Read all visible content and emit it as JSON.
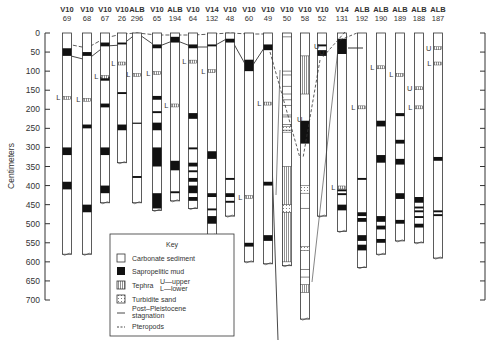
{
  "figure": {
    "y_axis_label": "Centimeters",
    "y_ticks": [
      "0",
      "50",
      "100",
      "150",
      "200",
      "250",
      "300",
      "350",
      "400",
      "450",
      "500",
      "550",
      "600",
      "650",
      "700"
    ],
    "colors": {
      "ink": "#222222",
      "background": "#ffffff",
      "tephra_fill": "#dddddd"
    }
  },
  "cores": [
    {
      "ship": "V10",
      "num": "69"
    },
    {
      "ship": "V10",
      "num": "68"
    },
    {
      "ship": "V10",
      "num": "67"
    },
    {
      "ship": "V10",
      "num": "26"
    },
    {
      "ship": "ALB",
      "num": "296"
    },
    {
      "ship": "V10",
      "num": "65"
    },
    {
      "ship": "ALB",
      "num": "194"
    },
    {
      "ship": "V10",
      "num": "64"
    },
    {
      "ship": "V14",
      "num": "132"
    },
    {
      "ship": "V10",
      "num": "48"
    },
    {
      "ship": "V10",
      "num": "60"
    },
    {
      "ship": "V10",
      "num": "49"
    },
    {
      "ship": "V10",
      "num": "50"
    },
    {
      "ship": "V10",
      "num": "58"
    },
    {
      "ship": "V10",
      "num": "52"
    },
    {
      "ship": "V14",
      "num": "131"
    },
    {
      "ship": "ALB",
      "num": "192"
    },
    {
      "ship": "ALB",
      "num": "190"
    },
    {
      "ship": "ALB",
      "num": "189"
    },
    {
      "ship": "ALB",
      "num": "188"
    },
    {
      "ship": "ALB",
      "num": "187"
    }
  ],
  "tephra_markers": {
    "upper": "U",
    "lower": "L"
  },
  "key": {
    "title": "Key",
    "items": [
      {
        "symbol": "carbonate-box",
        "label": "Carbonate sediment"
      },
      {
        "symbol": "sapropel-box",
        "label": "Sapropelitic mud"
      },
      {
        "symbol": "tephra-box",
        "label": "Tephra",
        "sub1": "U—upper",
        "sub2": "L—lower"
      },
      {
        "symbol": "turbidite-box",
        "label": "Turbidite sand"
      },
      {
        "symbol": "solid-line",
        "label": "Post–Pleistocene",
        "label2": "stagnation"
      },
      {
        "symbol": "dashed-line",
        "label": "Pteropods"
      }
    ]
  }
}
